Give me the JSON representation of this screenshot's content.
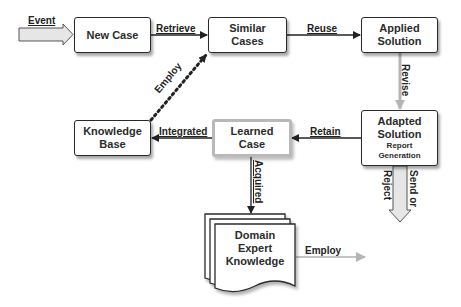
{
  "diagram": {
    "nodes": {
      "new_case": {
        "label": "New Case"
      },
      "similar_cases": {
        "line1": "Similar",
        "line2": "Cases"
      },
      "applied_solution": {
        "line1": "Applied",
        "line2": "Solution"
      },
      "adapted_solution": {
        "line1": "Adapted",
        "line2": "Solution",
        "sub1": "Report",
        "sub2": "Generation"
      },
      "knowledge_base": {
        "line1": "Knowledge",
        "line2": "Base"
      },
      "learned_case": {
        "line1": "Learned",
        "line2": "Case"
      },
      "domain_expert_knowledge": {
        "line1": "Domain",
        "line2": "Expert",
        "line3": "Knowledge"
      }
    },
    "edges": {
      "event": "Event",
      "retrieve": "Retrieve",
      "reuse": "Reuse",
      "revise": "Revise",
      "retain": "Retain",
      "integrated": "Integrated",
      "employ_dotted": "Employ",
      "acquired": "Acquired",
      "send_or_reject_1": "Send or",
      "send_or_reject_2": "Reject",
      "employ_expert": "Employ"
    },
    "colors": {
      "box_border": "#2a2a2a",
      "learned_border": "#b9b9b9",
      "fat_arrow_fill": "#e6e6e6",
      "gray_arrow": "#b5b5b5",
      "line": "#222222"
    }
  }
}
